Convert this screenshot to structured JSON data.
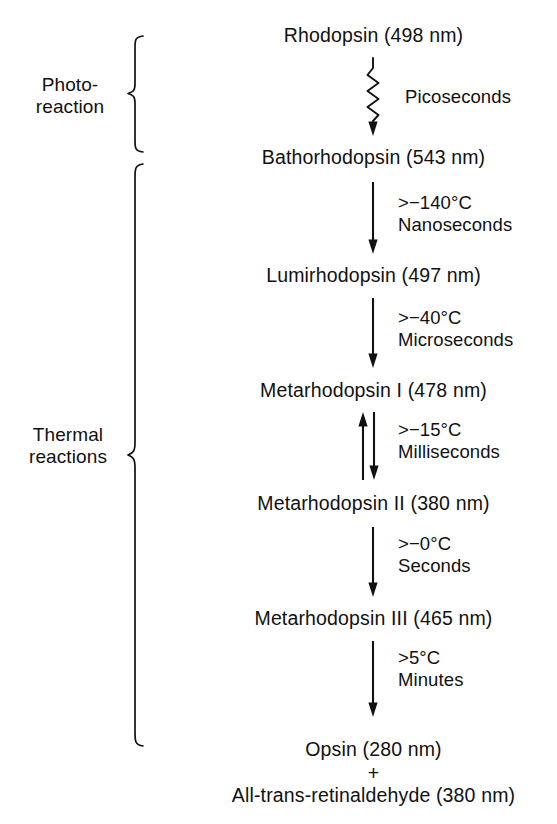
{
  "diagram": {
    "background_color": "#ffffff",
    "ink_color": "#111111",
    "groups": [
      {
        "id": "photoreaction",
        "label": "Photo-\nreaction"
      },
      {
        "id": "thermal",
        "label": "Thermal\nreactions"
      }
    ],
    "species": [
      {
        "id": "rhodopsin",
        "label": "Rhodopsin (498 nm)"
      },
      {
        "id": "bathorhodopsin",
        "label": "Bathorhodopsin (543 nm)"
      },
      {
        "id": "lumirhodopsin",
        "label": "Lumirhodopsin (497 nm)"
      },
      {
        "id": "metarhodopsin-1",
        "label": "Metarhodopsin I (478 nm)"
      },
      {
        "id": "metarhodopsin-2",
        "label": "Metarhodopsin II (380 nm)"
      },
      {
        "id": "metarhodopsin-3",
        "label": "Metarhodopsin III (465 nm)"
      },
      {
        "id": "opsin",
        "label": "Opsin (280 nm)"
      },
      {
        "id": "plus",
        "label": "+"
      },
      {
        "id": "retinaldehyde",
        "label": "All-trans-retinaldehyde (380 nm)"
      }
    ],
    "steps": [
      {
        "id": "step-photoreaction",
        "from": "rhodopsin",
        "to": "bathorhodopsin",
        "arrow": "wavy-down",
        "temperature": "",
        "timescale": "Picoseconds",
        "annotation": "Picoseconds"
      },
      {
        "id": "step-batho-to-lumi",
        "from": "bathorhodopsin",
        "to": "lumirhodopsin",
        "arrow": "straight-down",
        "temperature": ">−140°C",
        "timescale": "Nanoseconds",
        "annotation": ">−140°C\nNanoseconds"
      },
      {
        "id": "step-lumi-to-meta1",
        "from": "lumirhodopsin",
        "to": "metarhodopsin-1",
        "arrow": "straight-down",
        "temperature": ">−40°C",
        "timescale": "Microseconds",
        "annotation": ">−40°C\nMicroseconds"
      },
      {
        "id": "step-meta1-to-meta2",
        "from": "metarhodopsin-1",
        "to": "metarhodopsin-2",
        "arrow": "reversible",
        "temperature": ">−15°C",
        "timescale": "Milliseconds",
        "annotation": ">−15°C\nMilliseconds"
      },
      {
        "id": "step-meta2-to-meta3",
        "from": "metarhodopsin-2",
        "to": "metarhodopsin-3",
        "arrow": "straight-down",
        "temperature": ">−0°C",
        "timescale": "Seconds",
        "annotation": ">−0°C\nSeconds"
      },
      {
        "id": "step-meta3-to-opsin",
        "from": "metarhodopsin-3",
        "to": "opsin",
        "arrow": "straight-down",
        "temperature": ">5°C",
        "timescale": "Minutes",
        "annotation": ">5°C\nMinutes"
      }
    ]
  }
}
